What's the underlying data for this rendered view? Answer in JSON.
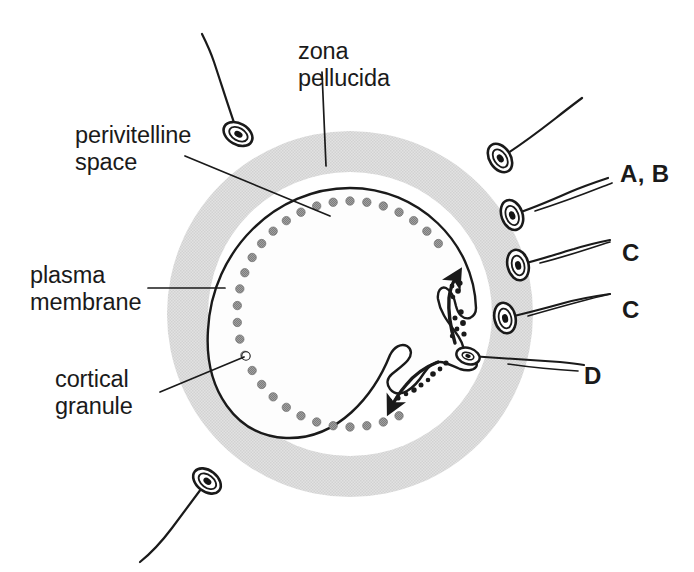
{
  "figure": {
    "colors": {
      "background": "#ffffff",
      "ink": "#1a1a1a",
      "zona_pellucida_fill": "#dedede",
      "perivitelline_fill": "#ffffff",
      "cytoplasm_fill": "#fefefe",
      "cortical_granule_fill": "#9a9a9a",
      "cortical_granule_stroke": "#6f6f6f",
      "membrane_stroke": "#1a1a1a",
      "sperm_fill": "#ffffff",
      "sperm_nucleus": "#141414"
    }
  },
  "structure_labels": [
    {
      "id": "zona-pellucida",
      "text": "zona\npellucida",
      "x": 298,
      "y": 38,
      "align": "left"
    },
    {
      "id": "perivitelline-space",
      "text": "perivitelline\nspace",
      "x": 75,
      "y": 122,
      "align": "left"
    },
    {
      "id": "plasma-membrane",
      "text": "plasma\nmembrane",
      "x": 30,
      "y": 262,
      "align": "left"
    },
    {
      "id": "cortical-granule",
      "text": "cortical\ngranule",
      "x": 55,
      "y": 366,
      "align": "left"
    }
  ],
  "key_labels": [
    {
      "id": "label-a-b",
      "text": "A, B",
      "x": 620,
      "y": 160
    },
    {
      "id": "label-c-1",
      "text": "C",
      "x": 622,
      "y": 239
    },
    {
      "id": "label-c-2",
      "text": "C",
      "x": 622,
      "y": 296
    },
    {
      "id": "label-d",
      "text": "D",
      "x": 584,
      "y": 362
    }
  ],
  "geometry": {
    "center": {
      "x": 350,
      "y": 314
    },
    "zona_outer_radius": 183,
    "zona_inner_radius": 142,
    "plasma_membrane_radius": 126,
    "cortical_granule_ring_radius": 113,
    "cortical_granule_count": 42,
    "cortical_granule_radius": 4.2
  },
  "sperm": [
    {
      "id": "sperm-free-top-left",
      "head_x": 238,
      "head_y": 134,
      "angle": -60,
      "scale": 1.0,
      "tail": "M 238 134 C 230 112 222 86 214 62 C 210 50 206 42 202 34"
    },
    {
      "id": "sperm-free-top-right",
      "head_x": 500,
      "head_y": 158,
      "angle": -33,
      "scale": 1.0,
      "tail": "M 500 158 C 520 146 538 132 556 118 C 566 110 574 104 582 98"
    },
    {
      "id": "sperm-at-zona-ab",
      "head_x": 512,
      "head_y": 215,
      "angle": -20,
      "scale": 1.0,
      "tail": "M 512 215 C 534 208 552 200 570 192 C 584 186 596 182 608 178"
    },
    {
      "id": "sperm-in-zona-c1",
      "head_x": 518,
      "head_y": 265,
      "angle": -14,
      "scale": 1.0,
      "tail": "M 518 265 C 540 260 556 254 574 249 C 590 244 600 242 610 240"
    },
    {
      "id": "sperm-in-zona-c2",
      "head_x": 505,
      "head_y": 318,
      "angle": -13,
      "scale": 1.0,
      "tail": "M 505 318 C 528 313 546 308 564 303 C 582 298 596 296 610 294"
    },
    {
      "id": "sperm-free-bottom-left",
      "head_x": 207,
      "head_y": 481,
      "angle": -52,
      "scale": 1.0,
      "tail": "M 207 481 C 196 496 184 512 172 528 C 160 544 150 554 140 562"
    }
  ],
  "fused_sperm": {
    "id": "sperm-fused-d",
    "head_x": 468,
    "head_y": 356,
    "tail": "M 470 356 C 500 358 530 360 560 362 C 570 363 578 364 584 365"
  },
  "cortical_reaction_arrows": [
    {
      "id": "arrow-upward",
      "path": "M 455 343 C 450 326 448 312 449 298 C 450 290 452 284 455 279",
      "direction": "up"
    },
    {
      "id": "arrow-downward",
      "path": "M 438 362 C 425 367 414 375 406 385 C 400 392 396 398 393 404",
      "direction": "down"
    }
  ],
  "leader_lines": [
    {
      "id": "leader-zona-pellucida",
      "path": "M 322 72 L 326 166"
    },
    {
      "id": "leader-perivitelline",
      "path": "M 185 156 L 330 216"
    },
    {
      "id": "leader-plasma-membrane",
      "path": "M 148 288 L 225 288"
    },
    {
      "id": "leader-cortical-granule",
      "path": "M 160 392 L 244 357"
    },
    {
      "id": "leader-a-b",
      "path": "M 535 211 C 570 200 594 190 612 183"
    },
    {
      "id": "leader-c-1",
      "path": "M 540 263 C 568 256 590 248 610 242"
    },
    {
      "id": "leader-c-2",
      "path": "M 528 316 C 556 308 584 300 610 294"
    },
    {
      "id": "leader-d",
      "path": "M 508 364 C 536 368 560 370 578 371"
    }
  ],
  "exocytosis_blebs": [
    {
      "x": 455,
      "y": 278,
      "r": 3.0
    },
    {
      "x": 460,
      "y": 283,
      "r": 2.6
    },
    {
      "x": 452,
      "y": 286,
      "r": 2.4
    },
    {
      "x": 458,
      "y": 291,
      "r": 2.8
    },
    {
      "x": 453,
      "y": 297,
      "r": 2.3
    },
    {
      "x": 461,
      "y": 312,
      "r": 2.7
    },
    {
      "x": 455,
      "y": 318,
      "r": 2.5
    },
    {
      "x": 463,
      "y": 323,
      "r": 2.9
    },
    {
      "x": 457,
      "y": 329,
      "r": 2.4
    },
    {
      "x": 464,
      "y": 334,
      "r": 2.6
    },
    {
      "x": 452,
      "y": 336,
      "r": 2.2
    },
    {
      "x": 446,
      "y": 363,
      "r": 2.6
    },
    {
      "x": 440,
      "y": 369,
      "r": 2.4
    },
    {
      "x": 433,
      "y": 374,
      "r": 2.8
    },
    {
      "x": 428,
      "y": 380,
      "r": 2.3
    },
    {
      "x": 421,
      "y": 385,
      "r": 2.5
    },
    {
      "x": 414,
      "y": 390,
      "r": 2.7
    },
    {
      "x": 406,
      "y": 394,
      "r": 2.3
    },
    {
      "x": 398,
      "y": 398,
      "r": 2.6
    },
    {
      "x": 390,
      "y": 401,
      "r": 2.4
    }
  ]
}
